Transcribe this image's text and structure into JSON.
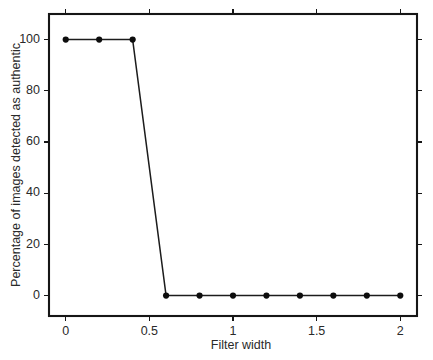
{
  "chart_data": {
    "type": "line",
    "title": "",
    "subtitle": "",
    "xlabel": "Filter width",
    "ylabel": "Percentage of images detected as authentic",
    "xlim": [
      -0.1,
      2.1
    ],
    "ylim": [
      -8,
      110
    ],
    "xticks": [
      0,
      0.5,
      1,
      1.5,
      2
    ],
    "xticklabels": [
      "0",
      "0.5",
      "1",
      "1.5",
      "2"
    ],
    "yticks": [
      0,
      20,
      40,
      60,
      80,
      100
    ],
    "yticklabels": [
      "0",
      "20",
      "40",
      "60",
      "80",
      "100"
    ],
    "grid": false,
    "legend": null,
    "frame": "box",
    "tick_direction": "out",
    "marker": "circle",
    "marker_color": "#0d0d0d",
    "line_color": "#1c1c1c",
    "background_color": "#ffffff",
    "x": [
      0,
      0.2,
      0.4,
      0.6,
      0.8,
      1,
      1.2,
      1.4,
      1.6,
      1.8,
      2
    ],
    "values": [
      100,
      100,
      100,
      0,
      0,
      0,
      0,
      0,
      0,
      0,
      0
    ],
    "series": [
      {
        "name": "Percentage of images detected as authentic",
        "x": [
          0,
          0.2,
          0.4,
          0.6,
          0.8,
          1,
          1.2,
          1.4,
          1.6,
          1.8,
          2
        ],
        "values": [
          100,
          100,
          100,
          0,
          0,
          0,
          0,
          0,
          0,
          0,
          0
        ]
      }
    ],
    "annotations": []
  }
}
